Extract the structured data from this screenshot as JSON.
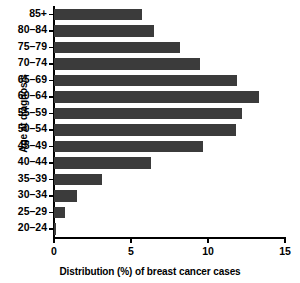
{
  "chart_data": {
    "type": "bar",
    "orientation": "horizontal",
    "title": "",
    "xlabel": "Distribution (%) of breast cancer cases",
    "ylabel": "Age at diagnosis",
    "categories": [
      "20–24",
      "25–29",
      "30–34",
      "35–39",
      "40–44",
      "45–49",
      "50–54",
      "55–59",
      "60–64",
      "65–69",
      "70–74",
      "75–79",
      "80–84",
      "85+"
    ],
    "values": [
      0.15,
      0.7,
      1.5,
      3.1,
      6.3,
      9.7,
      11.8,
      12.2,
      13.3,
      11.9,
      9.5,
      8.2,
      6.5,
      5.7
    ],
    "xlim": [
      0,
      15
    ],
    "xticks": [
      0,
      5,
      10,
      15
    ],
    "xtick_labels": [
      "0",
      "5",
      "10",
      "15"
    ],
    "grid": false,
    "legend": null,
    "bar_color": "#3b3b3b",
    "axis_color": "#000000",
    "background_color": "#ffffff"
  },
  "axes": {
    "y_title": "Age at diagnosis",
    "x_title": "Distribution (%) of breast cancer cases"
  }
}
